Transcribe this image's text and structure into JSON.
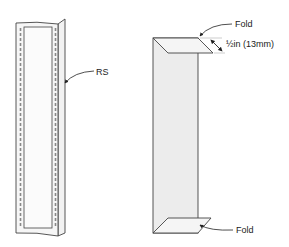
{
  "diagram": {
    "left_figure": {
      "label": "RS"
    },
    "right_figure": {
      "top_fold_label": "Fold",
      "bottom_fold_label": "Fold",
      "dimension_label": "½in (13mm)"
    },
    "colors": {
      "stroke": "#444444",
      "fill_light": "#f4f4f4",
      "fill_panel": "#ececec",
      "dashes": "#888888"
    }
  }
}
